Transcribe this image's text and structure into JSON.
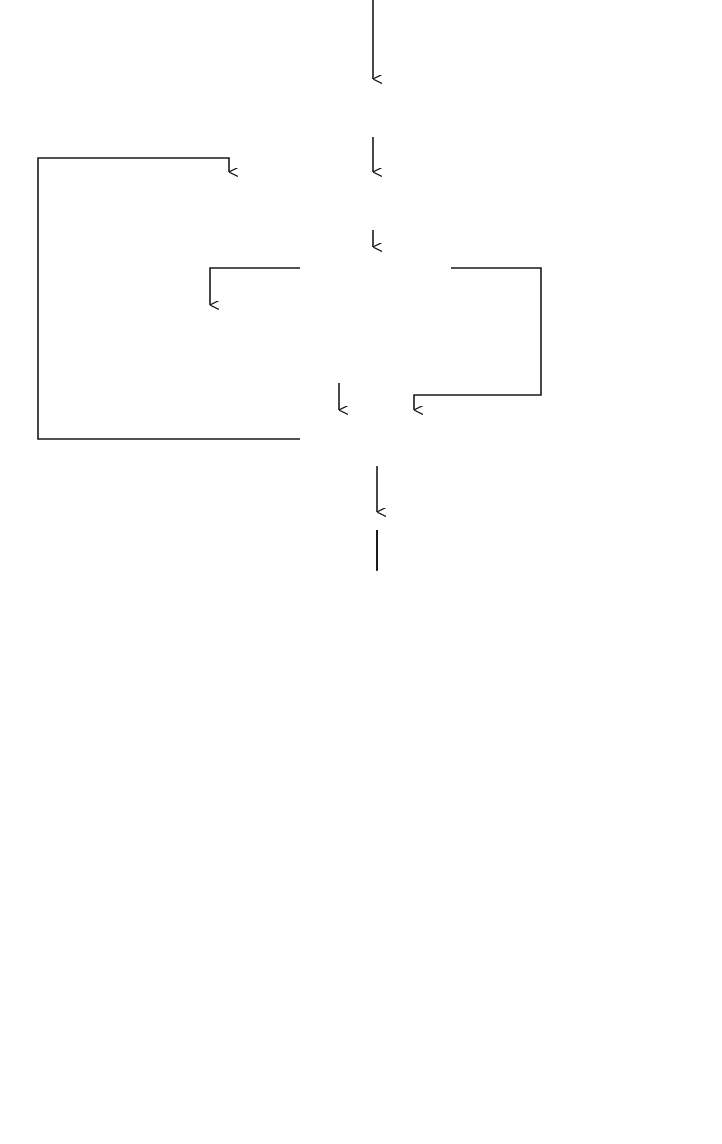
{
  "flowchart": {
    "nodes": {
      "read_bias": {
        "lines": [
          "READ IN BIAS",
          "PROBABILITY P"
        ],
        "subscript": "0"
      },
      "examine_matrix": {
        "lines": [
          "EXAMINE  PROBABILITY MATRIX",
          "ONE PAIR--ONE SYLLABLE, P(J,I)"
        ]
      },
      "compare": {
        "text": "P(J,I) > P",
        "subscript": "0"
      },
      "form_list": {
        "lines": [
          "FORM THE LIST OF MOST",
          "PROBABLE TRIPLETS: FIRST;",
          "SECOND=PAIR (J); THIRD=I"
        ]
      },
      "next_ji": {
        "text": "NEXT J,I"
      },
      "read_distance": {
        "text": "READ IN THE DISTANCE N"
      },
      "read_data": {
        "text": "READ IN DATA D(K)"
      },
      "extract": {
        "lines": [
          "EXTRACT FOUR SUBSEQUENT",
          "SYLLABLES"
        ],
        "formulas": [
          "X = D(K)",
          "Y = D(K+1)",
          "Z = D(K+2)",
          "W = D(K+2+N)"
        ]
      },
      "triplet_check": {
        "lines": [
          "TRIPLET (X,Y,Z) IS ON THE",
          "LIST OF SELECTED TRIPLETS ?"
        ]
      },
      "increment": {
        "lines": [
          "INCREMENT THE FIELD OF",
          "THE TRIPLET MATRIX",
          "P[(X,Y,Z),W] = P[(X,Y,Z),W] +1"
        ]
      },
      "end_record": {
        "text": "END OF RECORD"
      },
      "print_out": {
        "lines": [
          "PRINT OUT THE FREQUENCY",
          "AND PROBABILITY MATRIXES:",
          "ONE TRIPLET -- ONE SYLLABLE"
        ]
      }
    },
    "edge_labels": {
      "bigger": "BIGGER",
      "less": "LESS",
      "end": "END",
      "no_triplet": "NO",
      "yes_triplet": "YES",
      "no_record": "NO",
      "yes_record": "YES"
    },
    "inset": {
      "n1": "N=1",
      "n2": "N=2"
    }
  }
}
